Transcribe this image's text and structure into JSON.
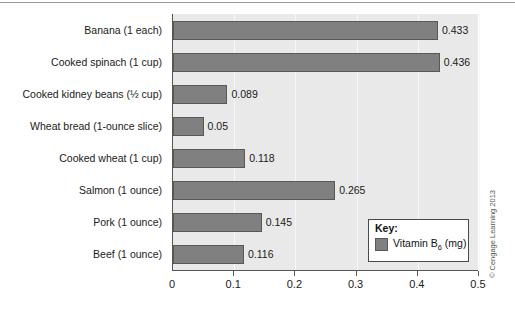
{
  "chart_data": {
    "type": "bar",
    "orientation": "horizontal",
    "title": "",
    "xlabel": "",
    "ylabel": "",
    "xlim": [
      0,
      0.5
    ],
    "xticks": [
      "0",
      "0.1",
      "0.2",
      "0.3",
      "0.4",
      "0.5"
    ],
    "xtick_values": [
      0,
      0.1,
      0.2,
      0.3,
      0.4,
      0.5
    ],
    "grid": true,
    "grid_axis": "x",
    "legend_position": "bottom-right",
    "categories": [
      "Banana (1 each)",
      "Cooked spinach (1 cup)",
      "Cooked kidney beans (½ cup)",
      "Wheat bread (1-ounce slice)",
      "Cooked wheat (1 cup)",
      "Salmon (1 ounce)",
      "Pork (1 ounce)",
      "Beef (1 ounce)"
    ],
    "values": [
      0.433,
      0.436,
      0.089,
      0.05,
      0.118,
      0.265,
      0.145,
      0.116
    ],
    "value_labels": [
      "0.433",
      "0.436",
      "0.089",
      "0.05",
      "0.118",
      "0.265",
      "0.145",
      "0.116"
    ],
    "series": [
      {
        "name": "Vitamin B6 (mg)",
        "values": [
          0.433,
          0.436,
          0.089,
          0.05,
          0.118,
          0.265,
          0.145,
          0.116
        ]
      }
    ],
    "bar_color": "#808080",
    "plot_background": "#e9e9e9"
  },
  "legend": {
    "title": "Key:",
    "entry_label_main": "Vitamin B",
    "entry_label_sub": "6",
    "entry_label_unit": " (mg)",
    "swatch_color": "#808080"
  },
  "credit": {
    "text": "© Cengage Learning 2013"
  }
}
